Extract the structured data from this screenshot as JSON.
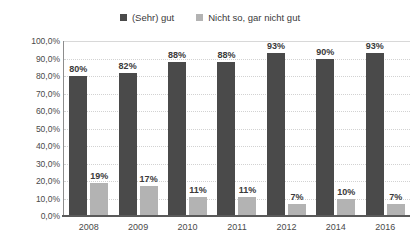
{
  "legend": {
    "position": "top-center",
    "items": [
      {
        "label": "(Sehr) gut",
        "color": "#4a4a4a",
        "swatch": "dark"
      },
      {
        "label": "Nicht so, gar nicht gut",
        "color": "#b3b3b3",
        "swatch": "light"
      }
    ]
  },
  "axis": {
    "y_title": "Anteil Befragte",
    "y_ticks": [
      "0,0%",
      "10,0%",
      "20,0%",
      "30,0%",
      "40,0%",
      "50,0%",
      "60,0%",
      "70,0%",
      "80,0%",
      "90,0%",
      "100,0%"
    ]
  },
  "chart_data": {
    "type": "bar",
    "title": "",
    "subtitle": "",
    "xlabel": "",
    "ylabel": "Anteil Befragte",
    "categories": [
      "2008",
      "2009",
      "2010",
      "2011",
      "2012",
      "2014",
      "2016"
    ],
    "series": [
      {
        "name": "(Sehr) gut",
        "color": "#4a4a4a",
        "values": [
          80,
          82,
          88,
          88,
          93,
          90,
          93
        ],
        "labels": [
          "80%",
          "82%",
          "88%",
          "88%",
          "93%",
          "90%",
          "93%"
        ]
      },
      {
        "name": "Nicht so, gar nicht gut",
        "color": "#b3b3b3",
        "values": [
          19,
          17,
          11,
          11,
          7,
          10,
          7
        ],
        "labels": [
          "19%",
          "17%",
          "11%",
          "11%",
          "7%",
          "10%",
          "7%"
        ]
      }
    ],
    "ylim": [
      0,
      100
    ],
    "ytick_step": 10,
    "ytick_labels": [
      "0,0%",
      "10,0%",
      "20,0%",
      "30,0%",
      "40,0%",
      "50,0%",
      "60,0%",
      "70,0%",
      "80,0%",
      "90,0%",
      "100,0%"
    ],
    "grid": true,
    "grid_axis": "y",
    "legend_position": "top",
    "value_labels": true,
    "units": "percent"
  }
}
